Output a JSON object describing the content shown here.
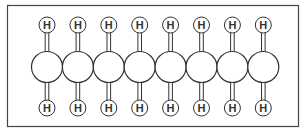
{
  "diagram": {
    "colors": {
      "stroke": "#333333",
      "fill": "#ffffff",
      "frame": "#444444"
    },
    "hydrogen_label": "H",
    "carbon_count": 8,
    "atoms": {
      "carbons": [
        {
          "id": "C1"
        },
        {
          "id": "C2"
        },
        {
          "id": "C3"
        },
        {
          "id": "C4"
        },
        {
          "id": "C5"
        },
        {
          "id": "C6"
        },
        {
          "id": "C7"
        },
        {
          "id": "C8"
        }
      ],
      "top_hydrogens": [
        "H",
        "H",
        "H",
        "H",
        "H",
        "H",
        "H",
        "H"
      ],
      "bottom_hydrogens": [
        "H",
        "H",
        "H",
        "H",
        "H",
        "H",
        "H",
        "H"
      ]
    }
  }
}
